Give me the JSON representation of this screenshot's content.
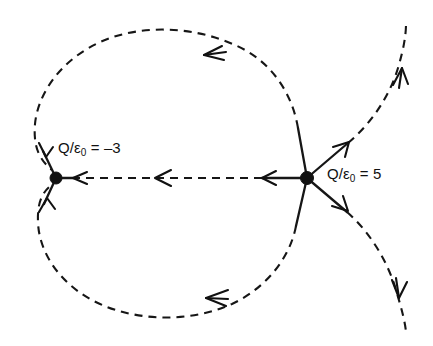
{
  "figure": {
    "type": "electric-field-line-diagram",
    "background_color": "#ffffff",
    "line_color": "#161616",
    "width": 433,
    "height": 346,
    "charges": [
      {
        "name": "negative-charge",
        "label_prefix": "Q/",
        "label_symbol": "ε",
        "label_subscript": "0",
        "label_equals": " = ",
        "label_value": "–3",
        "label_full": "Q/ε₀ = –3",
        "x": 56,
        "y": 178,
        "sign": "negative",
        "magnitude": 3,
        "field_lines_terminating": 3
      },
      {
        "name": "positive-charge",
        "label_prefix": "Q/",
        "label_symbol": "ε",
        "label_subscript": "0",
        "label_equals": " = ",
        "label_value": "5",
        "label_full": "Q/ε₀ = 5",
        "x": 307,
        "y": 178,
        "sign": "positive",
        "magnitude": 5,
        "field_lines_emanating": 5
      }
    ],
    "field_lines": [
      {
        "name": "upper-loop",
        "from": "positive-charge",
        "to": "negative-charge",
        "arrow_direction": "toward-negative"
      },
      {
        "name": "middle-straight-line",
        "from": "positive-charge",
        "to": "negative-charge",
        "arrow_direction": "leftward",
        "arrow_count": 3
      },
      {
        "name": "lower-loop",
        "from": "positive-charge",
        "to": "negative-charge",
        "arrow_direction": "toward-negative"
      },
      {
        "name": "upper-right-escape-line",
        "from": "positive-charge",
        "to": "infinity",
        "arrow_direction": "outward-up-right"
      },
      {
        "name": "lower-right-escape-line",
        "from": "positive-charge",
        "to": "infinity",
        "arrow_direction": "outward-down-right"
      }
    ]
  }
}
